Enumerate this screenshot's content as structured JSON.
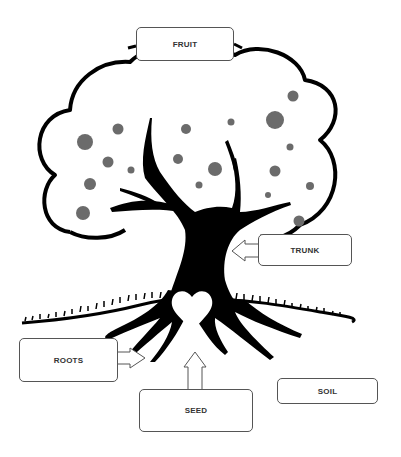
{
  "diagram": {
    "labels": {
      "fruit": "FRUIT",
      "trunk": "TRUNK",
      "roots": "ROOTS",
      "seed": "SEED",
      "soil": "SOIL"
    },
    "colors": {
      "outline": "#000000",
      "fruit_dots": "#6b6b6b",
      "background": "#ffffff",
      "box_border": "#555555"
    }
  }
}
